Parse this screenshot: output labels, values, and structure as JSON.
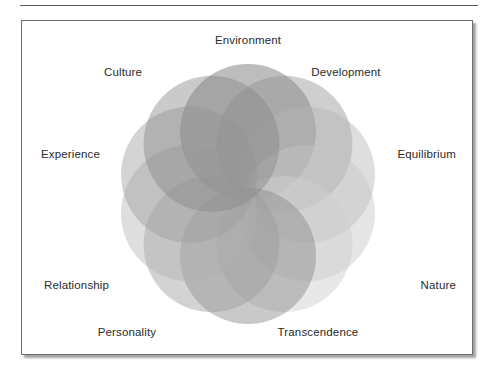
{
  "figure": {
    "type": "overlapping-circles-venn",
    "background_color": "#ffffff",
    "frame_border_color": "#6d6d6d",
    "rule_color": "#5b5b5b",
    "label_color": "#2a2a2a"
  },
  "chart_data": {
    "type": "pie",
    "title": "",
    "subtitle": "",
    "xlabel": "",
    "ylabel": "",
    "legend_position": "around-perimeter",
    "grid": false,
    "center": {
      "x": 226,
      "y": 173
    },
    "ring_radius": 62,
    "circle_radius": 68,
    "categories": [
      "Environment",
      "Development",
      "Equilibrium",
      "Nature",
      "Transcendence",
      "Personality",
      "Relationship",
      "Experience",
      "Culture",
      "Spirit"
    ],
    "values": [
      1,
      1,
      1,
      1,
      1,
      1,
      1,
      1,
      1,
      1
    ],
    "series": [
      {
        "name": "circles",
        "values": [
          1,
          1,
          1,
          1,
          1,
          1,
          1,
          1,
          1,
          1
        ]
      }
    ],
    "circles": [
      {
        "label": "Environment",
        "angle_deg": -90,
        "fill": "#707070",
        "opacity": 0.46
      },
      {
        "label": "Development",
        "angle_deg": -54,
        "fill": "#8c8c8c",
        "opacity": 0.42
      },
      {
        "label": "Equilibrium",
        "angle_deg": -18,
        "fill": "#b4b4b4",
        "opacity": 0.44
      },
      {
        "label": "Nature",
        "angle_deg": 18,
        "fill": "#c6c6c6",
        "opacity": 0.46
      },
      {
        "label": "Transcendence",
        "angle_deg": 54,
        "fill": "#cfcfcf",
        "opacity": 0.48
      },
      {
        "label": "Personality",
        "angle_deg": 90,
        "fill": "#8a8a8a",
        "opacity": 0.46
      },
      {
        "label": "Relationship",
        "angle_deg": 126,
        "fill": "#9a9a9a",
        "opacity": 0.44
      },
      {
        "label": "Experience",
        "angle_deg": 162,
        "fill": "#b0b0b0",
        "opacity": 0.42
      },
      {
        "label": "Culture",
        "angle_deg": 198,
        "fill": "#9c9c9c",
        "opacity": 0.44
      },
      {
        "label": "Spirit",
        "angle_deg": 234,
        "fill": "#868686",
        "opacity": 0.44
      }
    ],
    "tone_range": {
      "lightest": "#d6d6d6",
      "darkest": "#6a6a6a"
    }
  },
  "labels": {
    "environment": "Environment",
    "culture": "Culture",
    "development": "Development",
    "experience": "Experience",
    "equilibrium": "Equilibrium",
    "relationship": "Relationship",
    "nature": "Nature",
    "personality": "Personality",
    "transcendence": "Transcendence"
  }
}
